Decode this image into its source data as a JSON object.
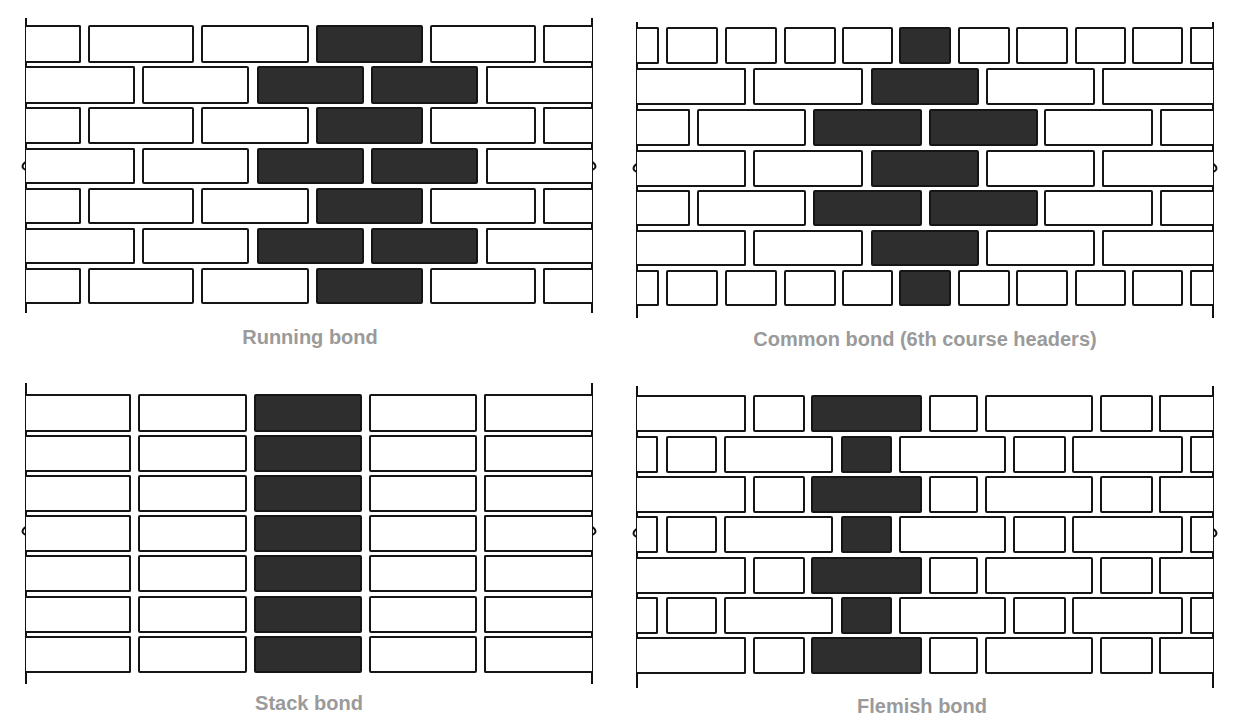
{
  "colors": {
    "mortar_line": "#151515",
    "highlight_brick": "#2e2e2e",
    "plain_brick": "#ffffff",
    "caption": "#9a9a9a"
  },
  "panels": [
    {
      "id": "running",
      "caption": "Running bond",
      "caption_pos": [
        310,
        338
      ],
      "wall": {
        "left": 26,
        "right": 592,
        "top": 18,
        "bottom": 313
      },
      "break_y": 170,
      "rows": [
        {
          "y": 25,
          "h": 38,
          "bricks": [
            [
              29,
              81,
              0
            ],
            [
              88,
              194,
              0
            ],
            [
              201,
              309,
              0
            ],
            [
              316,
              423,
              1
            ],
            [
              430,
              536,
              0
            ],
            [
              543,
              592,
              0
            ]
          ]
        },
        {
          "y": 66,
          "h": 38,
          "bricks": [
            [
              29,
              135,
              0
            ],
            [
              142,
              249,
              0
            ],
            [
              257,
              364,
              1
            ],
            [
              371,
              478,
              1
            ],
            [
              486,
              592,
              0
            ]
          ]
        },
        {
          "y": 107,
          "h": 37,
          "bricks": [
            [
              29,
              81,
              0
            ],
            [
              88,
              194,
              0
            ],
            [
              201,
              309,
              0
            ],
            [
              316,
              423,
              1
            ],
            [
              430,
              536,
              0
            ],
            [
              543,
              592,
              0
            ]
          ]
        },
        {
          "y": 148,
          "h": 36,
          "bricks": [
            [
              29,
              135,
              0
            ],
            [
              142,
              249,
              0
            ],
            [
              257,
              364,
              1
            ],
            [
              371,
              478,
              1
            ],
            [
              486,
              592,
              0
            ]
          ]
        },
        {
          "y": 188,
          "h": 36,
          "bricks": [
            [
              29,
              81,
              0
            ],
            [
              88,
              194,
              0
            ],
            [
              201,
              309,
              0
            ],
            [
              316,
              423,
              1
            ],
            [
              430,
              536,
              0
            ],
            [
              543,
              592,
              0
            ]
          ]
        },
        {
          "y": 228,
          "h": 36,
          "bricks": [
            [
              29,
              135,
              0
            ],
            [
              142,
              249,
              0
            ],
            [
              257,
              364,
              1
            ],
            [
              371,
              478,
              1
            ],
            [
              486,
              592,
              0
            ]
          ]
        },
        {
          "y": 268,
          "h": 36,
          "bricks": [
            [
              29,
              81,
              0
            ],
            [
              88,
              194,
              0
            ],
            [
              201,
              309,
              0
            ],
            [
              316,
              423,
              1
            ],
            [
              430,
              536,
              0
            ],
            [
              543,
              592,
              0
            ]
          ]
        }
      ]
    },
    {
      "id": "common",
      "caption": "Common bond (6th course headers)",
      "caption_pos": [
        925,
        340
      ],
      "wall": {
        "left": 637,
        "right": 1213,
        "top": 22,
        "bottom": 318
      },
      "break_y": 172,
      "rows": [
        {
          "y": 27,
          "h": 37,
          "bricks": [
            [
              639,
              659,
              0
            ],
            [
              666,
              718,
              0
            ],
            [
              725,
              777,
              0
            ],
            [
              784,
              836,
              0
            ],
            [
              842,
              893,
              0
            ],
            [
              899,
              951,
              1
            ],
            [
              958,
              1010,
              0
            ],
            [
              1016,
              1068,
              0
            ],
            [
              1075,
              1126,
              0
            ],
            [
              1132,
              1183,
              0
            ],
            [
              1190,
              1213,
              0
            ]
          ]
        },
        {
          "y": 68,
          "h": 37,
          "bricks": [
            [
              639,
              746,
              0
            ],
            [
              753,
              863,
              0
            ],
            [
              871,
              979,
              1
            ],
            [
              986,
              1095,
              0
            ],
            [
              1102,
              1213,
              0
            ]
          ]
        },
        {
          "y": 109,
          "h": 37,
          "bricks": [
            [
              639,
              690,
              0
            ],
            [
              697,
              806,
              0
            ],
            [
              813,
              922,
              1
            ],
            [
              929,
              1038,
              1
            ],
            [
              1044,
              1153,
              0
            ],
            [
              1160,
              1213,
              0
            ]
          ]
        },
        {
          "y": 150,
          "h": 37,
          "bricks": [
            [
              639,
              746,
              0
            ],
            [
              753,
              863,
              0
            ],
            [
              871,
              979,
              1
            ],
            [
              986,
              1095,
              0
            ],
            [
              1102,
              1213,
              0
            ]
          ]
        },
        {
          "y": 190,
          "h": 36,
          "bricks": [
            [
              639,
              690,
              0
            ],
            [
              697,
              806,
              0
            ],
            [
              813,
              922,
              1
            ],
            [
              929,
              1038,
              1
            ],
            [
              1044,
              1153,
              0
            ],
            [
              1160,
              1213,
              0
            ]
          ]
        },
        {
          "y": 230,
          "h": 36,
          "bricks": [
            [
              639,
              746,
              0
            ],
            [
              753,
              863,
              0
            ],
            [
              871,
              979,
              1
            ],
            [
              986,
              1095,
              0
            ],
            [
              1102,
              1213,
              0
            ]
          ]
        },
        {
          "y": 270,
          "h": 36,
          "bricks": [
            [
              639,
              659,
              0
            ],
            [
              666,
              718,
              0
            ],
            [
              725,
              777,
              0
            ],
            [
              784,
              836,
              0
            ],
            [
              842,
              893,
              0
            ],
            [
              899,
              951,
              1
            ],
            [
              958,
              1010,
              0
            ],
            [
              1016,
              1068,
              0
            ],
            [
              1075,
              1126,
              0
            ],
            [
              1132,
              1183,
              0
            ],
            [
              1190,
              1213,
              0
            ]
          ]
        }
      ]
    },
    {
      "id": "stack",
      "caption": "Stack bond",
      "caption_pos": [
        309,
        704
      ],
      "wall": {
        "left": 26,
        "right": 592,
        "top": 383,
        "bottom": 684
      },
      "break_y": 535,
      "rows": [
        {
          "y": 394,
          "h": 38,
          "bricks": [
            [
              26,
              131,
              0
            ],
            [
              138,
              247,
              0
            ],
            [
              254,
              362,
              1
            ],
            [
              369,
              477,
              0
            ],
            [
              484,
              592,
              0
            ]
          ]
        },
        {
          "y": 435,
          "h": 37,
          "bricks": [
            [
              26,
              131,
              0
            ],
            [
              138,
              247,
              0
            ],
            [
              254,
              362,
              1
            ],
            [
              369,
              477,
              0
            ],
            [
              484,
              592,
              0
            ]
          ]
        },
        {
          "y": 475,
          "h": 37,
          "bricks": [
            [
              26,
              131,
              0
            ],
            [
              138,
              247,
              0
            ],
            [
              254,
              362,
              1
            ],
            [
              369,
              477,
              0
            ],
            [
              484,
              592,
              0
            ]
          ]
        },
        {
          "y": 515,
          "h": 37,
          "bricks": [
            [
              26,
              131,
              0
            ],
            [
              138,
              247,
              0
            ],
            [
              254,
              362,
              1
            ],
            [
              369,
              477,
              0
            ],
            [
              484,
              592,
              0
            ]
          ]
        },
        {
          "y": 555,
          "h": 37,
          "bricks": [
            [
              26,
              131,
              0
            ],
            [
              138,
              247,
              0
            ],
            [
              254,
              362,
              1
            ],
            [
              369,
              477,
              0
            ],
            [
              484,
              592,
              0
            ]
          ]
        },
        {
          "y": 596,
          "h": 37,
          "bricks": [
            [
              26,
              131,
              0
            ],
            [
              138,
              247,
              0
            ],
            [
              254,
              362,
              1
            ],
            [
              369,
              477,
              0
            ],
            [
              484,
              592,
              0
            ]
          ]
        },
        {
          "y": 636,
          "h": 37,
          "bricks": [
            [
              26,
              131,
              0
            ],
            [
              138,
              247,
              0
            ],
            [
              254,
              362,
              1
            ],
            [
              369,
              477,
              0
            ],
            [
              484,
              592,
              0
            ]
          ]
        }
      ]
    },
    {
      "id": "flemish",
      "caption": "Flemish bond",
      "caption_pos": [
        922,
        707
      ],
      "wall": {
        "left": 637,
        "right": 1213,
        "top": 386,
        "bottom": 688
      },
      "break_y": 537,
      "rows": [
        {
          "y": 395,
          "h": 37,
          "bricks": [
            [
              639,
              746,
              0
            ],
            [
              753,
              805,
              0
            ],
            [
              811,
              922,
              1
            ],
            [
              929,
              978,
              0
            ],
            [
              985,
              1093,
              0
            ],
            [
              1100,
              1153,
              0
            ],
            [
              1159,
              1213,
              0
            ]
          ]
        },
        {
          "y": 436,
          "h": 37,
          "bricks": [
            [
              639,
              658,
              0
            ],
            [
              666,
              717,
              0
            ],
            [
              724,
              833,
              0
            ],
            [
              841,
              892,
              1
            ],
            [
              899,
              1006,
              0
            ],
            [
              1013,
              1066,
              0
            ],
            [
              1072,
              1183,
              0
            ],
            [
              1190,
              1213,
              0
            ]
          ]
        },
        {
          "y": 476,
          "h": 37,
          "bricks": [
            [
              639,
              746,
              0
            ],
            [
              753,
              805,
              0
            ],
            [
              811,
              922,
              1
            ],
            [
              929,
              978,
              0
            ],
            [
              985,
              1093,
              0
            ],
            [
              1100,
              1153,
              0
            ],
            [
              1159,
              1213,
              0
            ]
          ]
        },
        {
          "y": 516,
          "h": 37,
          "bricks": [
            [
              639,
              658,
              0
            ],
            [
              666,
              717,
              0
            ],
            [
              724,
              833,
              0
            ],
            [
              841,
              892,
              1
            ],
            [
              899,
              1006,
              0
            ],
            [
              1013,
              1066,
              0
            ],
            [
              1072,
              1183,
              0
            ],
            [
              1190,
              1213,
              0
            ]
          ]
        },
        {
          "y": 557,
          "h": 37,
          "bricks": [
            [
              639,
              746,
              0
            ],
            [
              753,
              805,
              0
            ],
            [
              811,
              922,
              1
            ],
            [
              929,
              978,
              0
            ],
            [
              985,
              1093,
              0
            ],
            [
              1100,
              1153,
              0
            ],
            [
              1159,
              1213,
              0
            ]
          ]
        },
        {
          "y": 597,
          "h": 37,
          "bricks": [
            [
              639,
              658,
              0
            ],
            [
              666,
              717,
              0
            ],
            [
              724,
              833,
              0
            ],
            [
              841,
              892,
              1
            ],
            [
              899,
              1006,
              0
            ],
            [
              1013,
              1066,
              0
            ],
            [
              1072,
              1183,
              0
            ],
            [
              1190,
              1213,
              0
            ]
          ]
        },
        {
          "y": 637,
          "h": 37,
          "bricks": [
            [
              639,
              746,
              0
            ],
            [
              753,
              805,
              0
            ],
            [
              811,
              922,
              1
            ],
            [
              929,
              978,
              0
            ],
            [
              985,
              1093,
              0
            ],
            [
              1100,
              1153,
              0
            ],
            [
              1159,
              1213,
              0
            ]
          ]
        }
      ]
    }
  ]
}
